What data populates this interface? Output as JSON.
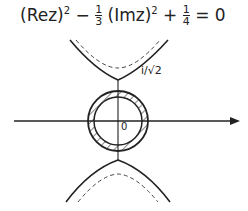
{
  "figure": {
    "equation": "(Rez)² − ⅓(Imz)² + ¼ = 0",
    "equation_parts": {
      "term1": "(Rez)",
      "exp1": "2",
      "minus": "−",
      "frac1_num": "1",
      "frac1_den": "3",
      "term2": "(Imz)",
      "exp2": "2",
      "plus": "+",
      "frac2_num": "1",
      "frac2_den": "4",
      "equals": "= 0"
    },
    "vertex_label": "i/√2",
    "origin_label": "0",
    "colors": {
      "ink": "#222222",
      "background": "#ffffff"
    }
  }
}
